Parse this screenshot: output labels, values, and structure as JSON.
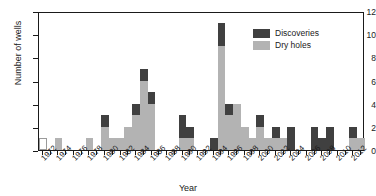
{
  "chart_data": {
    "type": "bar",
    "stacked": true,
    "title": "",
    "xlabel": "Year",
    "ylabel": "Number of wells",
    "ylim": [
      0,
      12
    ],
    "ytick_step": 2,
    "yticks": [
      0,
      2,
      4,
      6,
      8,
      10,
      12
    ],
    "xlim": [
      1972,
      2013
    ],
    "xtick_step": 2,
    "xticks": [
      1972,
      1974,
      1976,
      1978,
      1980,
      1982,
      1984,
      1986,
      1988,
      1990,
      1992,
      1994,
      1996,
      1998,
      2000,
      2002,
      2004,
      2006,
      2008,
      2010,
      2012
    ],
    "grid": false,
    "legend_position": "top-right",
    "legend": [
      {
        "name": "Discoveries",
        "color": "#404040"
      },
      {
        "name": "Dry holes",
        "color": "#b3b3b3"
      }
    ],
    "categories": [
      1972,
      1973,
      1974,
      1975,
      1976,
      1977,
      1978,
      1979,
      1980,
      1981,
      1982,
      1983,
      1984,
      1985,
      1986,
      1987,
      1988,
      1989,
      1990,
      1991,
      1992,
      1993,
      1994,
      1995,
      1996,
      1997,
      1998,
      1999,
      2000,
      2001,
      2002,
      2003,
      2004,
      2005,
      2006,
      2007,
      2008,
      2009,
      2010,
      2011,
      2012,
      2013
    ],
    "series": [
      {
        "name": "Dry holes",
        "color": "#b3b3b3",
        "values": [
          0,
          0,
          1,
          0,
          0,
          0,
          1,
          0,
          2,
          1,
          1,
          2,
          3,
          6,
          4,
          0,
          0,
          0,
          1,
          1,
          0,
          0,
          0,
          9,
          3,
          4,
          2,
          1,
          2,
          1,
          1,
          1,
          0,
          0,
          0,
          0,
          0,
          0,
          0,
          0,
          1,
          1
        ]
      },
      {
        "name": "Discoveries",
        "color": "#404040",
        "values": [
          0,
          0,
          0,
          0,
          0,
          0,
          0,
          0,
          1,
          0,
          0,
          0,
          1,
          1,
          1,
          0,
          0,
          0,
          2,
          1,
          0,
          0,
          1,
          2,
          1,
          0,
          0,
          0,
          1,
          0,
          1,
          0,
          2,
          0,
          0,
          2,
          1,
          2,
          0,
          0,
          1,
          0
        ]
      }
    ],
    "unfilled_bars": [
      {
        "year": 1972,
        "value": 1,
        "note": "open/white outlined bar"
      }
    ],
    "totals": [
      1,
      0,
      1,
      0,
      0,
      0,
      1,
      0,
      3,
      1,
      1,
      2,
      4,
      7,
      5,
      0,
      0,
      0,
      3,
      2,
      0,
      0,
      1,
      11,
      4,
      4,
      2,
      1,
      3,
      1,
      2,
      1,
      2,
      0,
      0,
      2,
      1,
      2,
      0,
      0,
      2,
      1
    ]
  }
}
